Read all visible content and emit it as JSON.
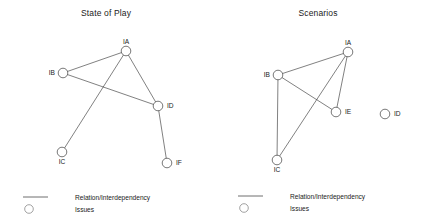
{
  "figure": {
    "width": 424,
    "height": 224,
    "background": "#ffffff",
    "stroke_color": "#3d3d3d",
    "node_fill": "#ffffff",
    "text_color": "#1a1a1a"
  },
  "panels": [
    {
      "id": "state-of-play",
      "title": "State of Play",
      "nodes": [
        {
          "id": "IA",
          "label": "IA",
          "cx": 126,
          "cy": 51,
          "r": 4.8,
          "label_dx": 0,
          "label_dy": -7.5,
          "label_anchor": "middle"
        },
        {
          "id": "IB",
          "label": "IB",
          "cx": 63,
          "cy": 73,
          "r": 4.8,
          "label_dx": -8,
          "label_dy": 2,
          "label_anchor": "end"
        },
        {
          "id": "IC",
          "label": "IC",
          "cx": 62,
          "cy": 152,
          "r": 4.8,
          "label_dx": 0,
          "label_dy": 11.5,
          "label_anchor": "middle"
        },
        {
          "id": "ID",
          "label": "ID",
          "cx": 158,
          "cy": 106,
          "r": 4.8,
          "label_dx": 9,
          "label_dy": 2,
          "label_anchor": "start"
        },
        {
          "id": "IF",
          "label": "IF",
          "cx": 167,
          "cy": 163,
          "r": 4.8,
          "label_dx": 9,
          "label_dy": 2,
          "label_anchor": "start"
        }
      ],
      "edges": [
        {
          "from": "IA",
          "to": "IB"
        },
        {
          "from": "IA",
          "to": "ID"
        },
        {
          "from": "IA",
          "to": "IC"
        },
        {
          "from": "IB",
          "to": "ID"
        },
        {
          "from": "ID",
          "to": "IF"
        }
      ],
      "legend": {
        "line_label": "Relation/Interdependency",
        "circle_label": "Issues",
        "line_x1": 23,
        "line_x2": 48,
        "line_y": 197,
        "circle_cx": 29,
        "circle_cy": 209,
        "circle_r": 4.3,
        "text_x": 75,
        "line_text_y": 199.5,
        "circle_text_y": 211.5
      }
    },
    {
      "id": "scenarios",
      "title": "Scenarios",
      "nodes": [
        {
          "id": "IA",
          "label": "IA",
          "cx": 136,
          "cy": 52,
          "r": 4.8,
          "label_dx": 0,
          "label_dy": -7.5,
          "label_anchor": "middle"
        },
        {
          "id": "IB",
          "label": "IB",
          "cx": 66,
          "cy": 75,
          "r": 4.8,
          "label_dx": -8,
          "label_dy": 2,
          "label_anchor": "end"
        },
        {
          "id": "IC",
          "label": "IC",
          "cx": 65,
          "cy": 160,
          "r": 4.8,
          "label_dx": 0,
          "label_dy": 11.5,
          "label_anchor": "middle"
        },
        {
          "id": "IE",
          "label": "IE",
          "cx": 124,
          "cy": 112,
          "r": 4.8,
          "label_dx": 9,
          "label_dy": 2,
          "label_anchor": "start"
        },
        {
          "id": "ID",
          "label": "ID",
          "cx": 173,
          "cy": 114,
          "r": 4.8,
          "label_dx": 9,
          "label_dy": 2,
          "label_anchor": "start"
        }
      ],
      "edges": [
        {
          "from": "IA",
          "to": "IB"
        },
        {
          "from": "IA",
          "to": "IE"
        },
        {
          "from": "IA",
          "to": "IC"
        },
        {
          "from": "IB",
          "to": "IE"
        },
        {
          "from": "IB",
          "to": "IC"
        }
      ],
      "legend": {
        "line_label": "Relation/Interdependency",
        "circle_label": "Issues",
        "line_x1": 26,
        "line_x2": 51,
        "line_y": 196,
        "circle_cx": 32,
        "circle_cy": 208,
        "circle_r": 4.3,
        "text_x": 78,
        "line_text_y": 198.5,
        "circle_text_y": 210.5
      }
    }
  ]
}
